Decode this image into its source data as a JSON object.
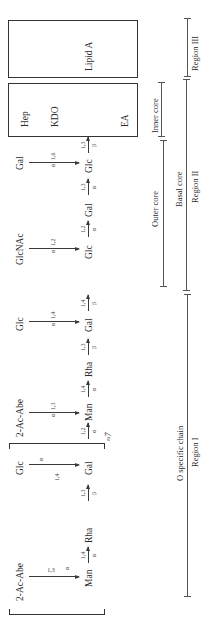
{
  "diagram": {
    "type": "lipopolysaccharide-structure",
    "orientation": "rotated-90-ccw",
    "main_chain": [
      {
        "label": "Man",
        "link_to_next": {
          "pos": "1,4",
          "anomer": "α"
        }
      },
      {
        "label": "Rha",
        "link_to_next": {
          "pos": "1,3",
          "anomer": "β"
        }
      },
      {
        "label": "Gal",
        "link_to_next": {
          "pos": "1,2",
          "anomer": "α"
        }
      },
      {
        "label": "Man",
        "link_to_next": {
          "pos": "1,4",
          "anomer": "α"
        }
      },
      {
        "label": "Rha",
        "link_to_next": {
          "pos": "1,3",
          "anomer": "β"
        }
      },
      {
        "label": "Gal",
        "link_to_next": {
          "pos": "1,4",
          "anomer": "β"
        }
      },
      {
        "label": "Glc",
        "link_to_next": {
          "pos": "1,2",
          "anomer": "α"
        }
      },
      {
        "label": "Gal",
        "link_to_next": {
          "pos": "1,3",
          "anomer": "α"
        }
      },
      {
        "label": "Glc",
        "link_to_next": {
          "pos": "1,3",
          "anomer": "β"
        }
      }
    ],
    "branches": [
      {
        "label": "2-Ac-Abe",
        "link": "1,3",
        "anomer": "α",
        "target_index": 0
      },
      {
        "label": "Glc",
        "link": "1,4",
        "anomer": "α",
        "target_index": 2
      },
      {
        "label": "2-Ac-Abe",
        "link": "1,3",
        "anomer": "α",
        "target_index": 3
      },
      {
        "label": "Glc",
        "link": "1,4",
        "anomer": "α",
        "target_index": 5
      },
      {
        "label": "GlcNAc",
        "link": "1,2",
        "anomer": "α",
        "target_index": 6
      },
      {
        "label": "Gal",
        "link": "1,6",
        "anomer": "α",
        "target_index": 8
      }
    ],
    "repeat_label": "≈7",
    "core_box": {
      "top": "Hep",
      "middle": "KDO",
      "bottom": "EA"
    },
    "lipid_box": {
      "label": "Lipid A"
    },
    "spans": {
      "inner_core": "Inner core",
      "outer_core": "Outer core",
      "basal_core": "Basal core",
      "region_2": "Region II",
      "o_chain": "O specific chain",
      "region_1": "Region I",
      "region_3": "Region III"
    }
  }
}
